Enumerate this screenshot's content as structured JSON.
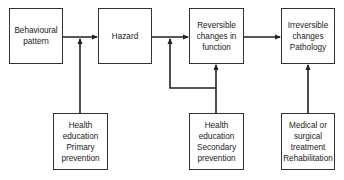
{
  "diagram": {
    "top_row": [
      {
        "id": "behavioural",
        "label": "Behavioural\npattern"
      },
      {
        "id": "hazard",
        "label": "Hazard"
      },
      {
        "id": "reversible",
        "label": "Reversible\nchanges in\nfunction"
      },
      {
        "id": "irreversible",
        "label": "Irreversible\nchanges\nPathology"
      }
    ],
    "bottom_row": [
      {
        "id": "primary",
        "label": "Health\neducation\nPrimary\nprevention"
      },
      {
        "id": "secondary",
        "label": "Health\neducation\nSecondary\nprevention"
      },
      {
        "id": "medical",
        "label": "Medical or\nsurgical\ntreatment\nRehabilitation"
      }
    ],
    "edges": [
      {
        "from": "behavioural",
        "to": "hazard"
      },
      {
        "from": "hazard",
        "to": "reversible"
      },
      {
        "from": "reversible",
        "to": "irreversible"
      },
      {
        "from": "primary",
        "to": "behavioural->hazard"
      },
      {
        "from": "secondary",
        "to": "hazard->reversible"
      },
      {
        "from": "secondary",
        "to": "reversible"
      },
      {
        "from": "medical",
        "to": "irreversible"
      }
    ]
  }
}
